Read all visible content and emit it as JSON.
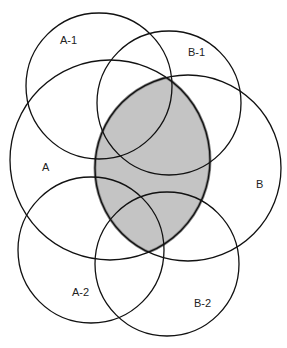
{
  "diagram": {
    "type": "venn",
    "colors": {
      "stroke": "#111111",
      "shade_fill": "#c4c4c4",
      "shade_stroke": "#8a8a8a",
      "background": "#ffffff"
    },
    "circles": [
      {
        "id": "A-1",
        "label": "A-1",
        "cx": 99,
        "cy": 86,
        "r": 73,
        "lx": 60,
        "ly": 44
      },
      {
        "id": "B-1",
        "label": "B-1",
        "cx": 169,
        "cy": 103,
        "r": 72,
        "lx": 188,
        "ly": 56
      },
      {
        "id": "A",
        "label": "A",
        "cx": 110,
        "cy": 160,
        "r": 100,
        "lx": 42,
        "ly": 171
      },
      {
        "id": "B",
        "label": "B",
        "cx": 188,
        "cy": 168,
        "r": 93,
        "lx": 256,
        "ly": 188
      },
      {
        "id": "A-2",
        "label": "A-2",
        "cx": 91,
        "cy": 250,
        "r": 73,
        "lx": 72,
        "ly": 296
      },
      {
        "id": "B-2",
        "label": "B-2",
        "cx": 167,
        "cy": 264,
        "r": 72,
        "lx": 194,
        "ly": 307
      }
    ],
    "shaded_region": "A ∩ B"
  }
}
